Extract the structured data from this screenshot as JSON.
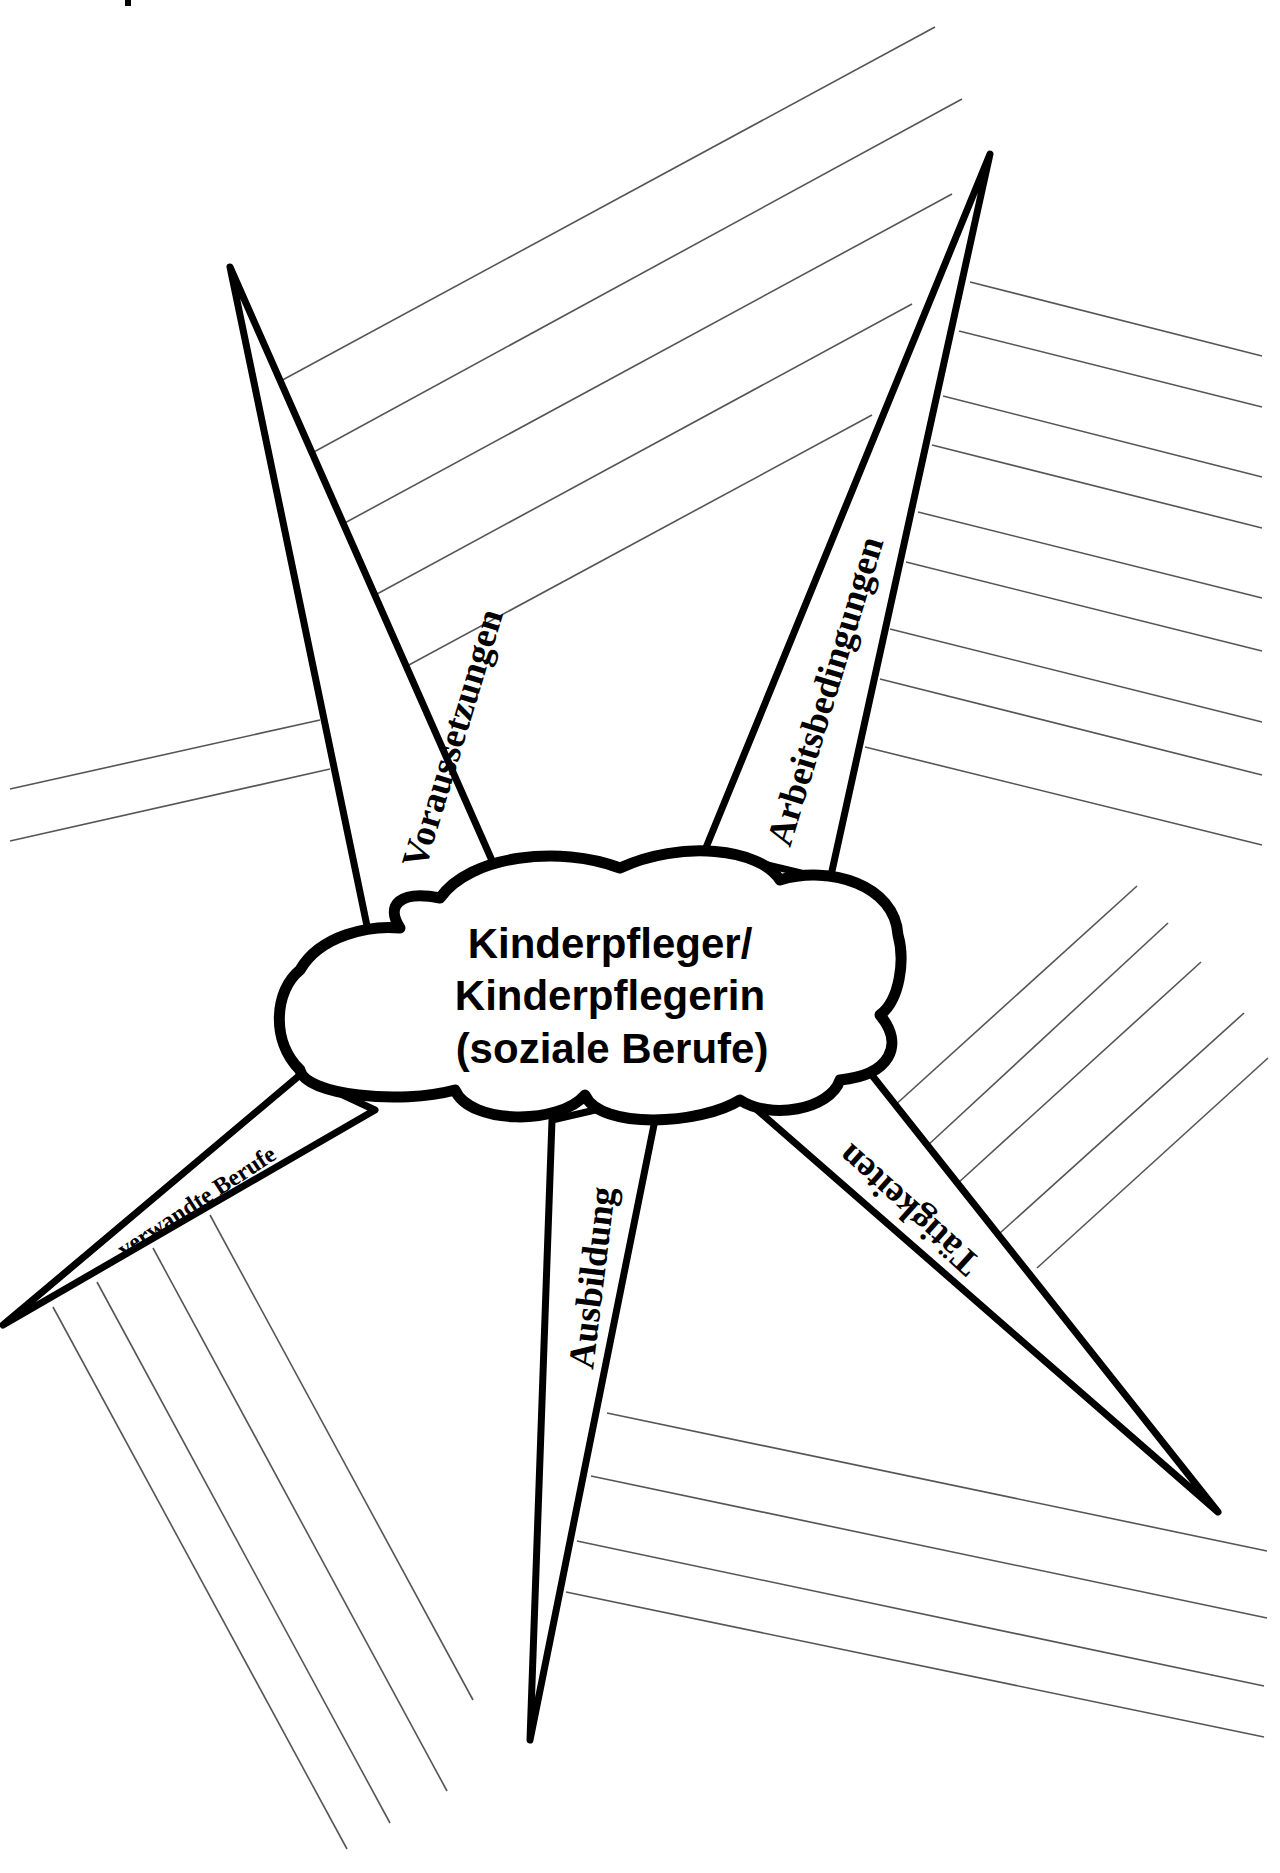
{
  "diagram": {
    "type": "mind-map worksheet",
    "center": {
      "lines": [
        "Kinderpfleger/",
        "Kinderpflegerin",
        "(soziale Berufe)"
      ]
    },
    "arms": [
      {
        "id": "voraussetzungen",
        "label": "Voraussetzungen",
        "blank_lines": 7
      },
      {
        "id": "arbeitsbedingungen",
        "label": "Arbeitsbedingungen",
        "blank_lines": 9
      },
      {
        "id": "taetigkeiten",
        "label": "Tätigkeiten",
        "blank_lines": 5
      },
      {
        "id": "ausbildung",
        "label": "Ausbildung",
        "blank_lines": 4
      },
      {
        "id": "verwandte-berufe",
        "label": "verwandte Berufe",
        "blank_lines": 4
      }
    ],
    "colors": {
      "outline": "#000000",
      "writing_lines": "#555555",
      "background": "#ffffff"
    }
  }
}
